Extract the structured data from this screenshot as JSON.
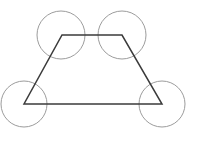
{
  "figure": {
    "canvas": {
      "width": 198,
      "height": 146,
      "background": "#ffffff"
    },
    "colors": {
      "circle_stroke": "#9c9c9c",
      "polygon_stroke": "#3b3b3b",
      "background": "#ffffff"
    },
    "polygon": {
      "name": "isosceles-trapezoid",
      "stroke": "#3b3b3b",
      "stroke_width": 1.5,
      "points": "62,35 122,35 162,104 24,104",
      "vertices": [
        {
          "label": "top-left",
          "x": 62,
          "y": 35
        },
        {
          "label": "top-right",
          "x": 122,
          "y": 35
        },
        {
          "label": "bottom-right",
          "x": 162,
          "y": 104
        },
        {
          "label": "bottom-left",
          "x": 24,
          "y": 104
        }
      ]
    },
    "circles": [
      {
        "name": "circle-top-left",
        "cx": 61,
        "cy": 35,
        "r": 24,
        "stroke": "#9c9c9c",
        "stroke_width": 1
      },
      {
        "name": "circle-top-right",
        "cx": 122,
        "cy": 35,
        "r": 24,
        "stroke": "#9c9c9c",
        "stroke_width": 1
      },
      {
        "name": "circle-bottom-left",
        "cx": 24,
        "cy": 104,
        "r": 23,
        "stroke": "#9c9c9c",
        "stroke_width": 1
      },
      {
        "name": "circle-bottom-right",
        "cx": 162,
        "cy": 104,
        "r": 23,
        "stroke": "#9c9c9c",
        "stroke_width": 1
      }
    ]
  }
}
